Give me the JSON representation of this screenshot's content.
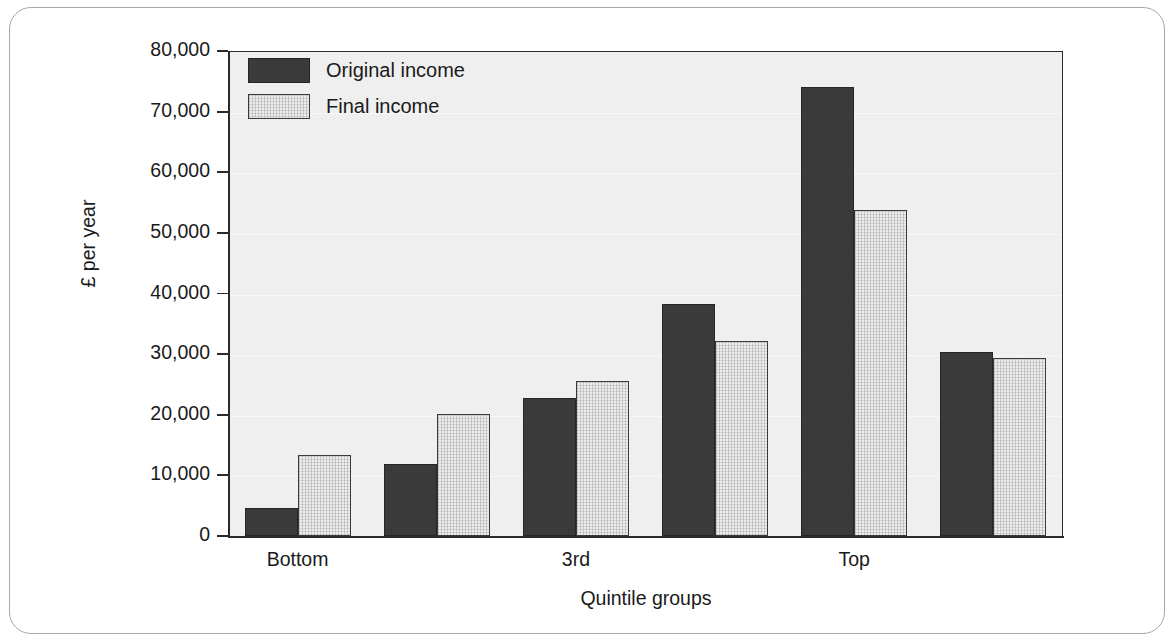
{
  "chart_data": {
    "type": "bar",
    "title": "",
    "xlabel": "Quintile groups",
    "ylabel": "£ per year",
    "ylim": [
      0,
      80000
    ],
    "ytick_values": [
      0,
      10000,
      20000,
      30000,
      40000,
      50000,
      60000,
      70000,
      80000
    ],
    "ytick_labels": [
      "0",
      "10,000",
      "20,000",
      "30,000",
      "40,000",
      "50,000",
      "60,000",
      "70,000",
      "80,000"
    ],
    "grid": "horizontal-faint",
    "legend_position": "top-left-inside",
    "categories": [
      "Bottom",
      "2nd",
      "3rd",
      "4th",
      "Top",
      "All households"
    ],
    "xtick_labels_shown": [
      "Bottom",
      "3rd",
      "Top"
    ],
    "series": [
      {
        "name": "Original income",
        "color": "#3a3a3a",
        "values": [
          4700,
          11800,
          22800,
          38300,
          74000,
          30300
        ]
      },
      {
        "name": "Final income",
        "color": "#ececec",
        "values": [
          13400,
          20100,
          25600,
          32100,
          53800,
          29400
        ]
      }
    ]
  },
  "axes": {
    "y_label": "£ per year",
    "x_label": "Quintile groups",
    "y_ticks": [
      {
        "label": "80,000",
        "value": 80000
      },
      {
        "label": "70,000",
        "value": 70000
      },
      {
        "label": "60,000",
        "value": 60000
      },
      {
        "label": "50,000",
        "value": 50000
      },
      {
        "label": "40,000",
        "value": 40000
      },
      {
        "label": "30,000",
        "value": 30000
      },
      {
        "label": "20,000",
        "value": 20000
      },
      {
        "label": "10,000",
        "value": 10000
      },
      {
        "label": "0",
        "value": 0
      }
    ],
    "x_ticks": [
      {
        "label": "Bottom",
        "group_index": 0
      },
      {
        "label": "3rd",
        "group_index": 2
      },
      {
        "label": "Top",
        "group_index": 4
      }
    ]
  },
  "legend": {
    "items": [
      {
        "label": "Original income",
        "swatch": "original"
      },
      {
        "label": "Final income",
        "swatch": "final"
      }
    ]
  },
  "colors": {
    "original_bar": "#3a3a3a",
    "final_bar": "#ececec",
    "plot_background": "#efefef",
    "axis": "#2b2b2b",
    "frame_border": "#a8a8a8",
    "text": "#1a1a1a"
  }
}
